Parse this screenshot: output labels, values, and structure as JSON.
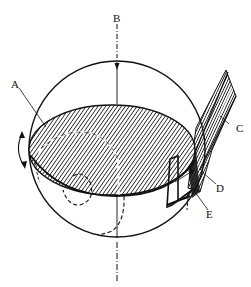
{
  "diagram": {
    "type": "labeled-sphere-cross-section",
    "background": "#ffffff",
    "ink_color": "#111111",
    "labels": {
      "A": "A",
      "B": "B",
      "C": "C",
      "D": "D",
      "E": "E"
    },
    "elements": {
      "sphere": "outer circle",
      "plane": "hatched elliptical section",
      "axis": "vertical dash-dot axis through B",
      "fibers": "bundle of strands at right edge",
      "rotation_arrow": "curved double arrow on left"
    }
  }
}
